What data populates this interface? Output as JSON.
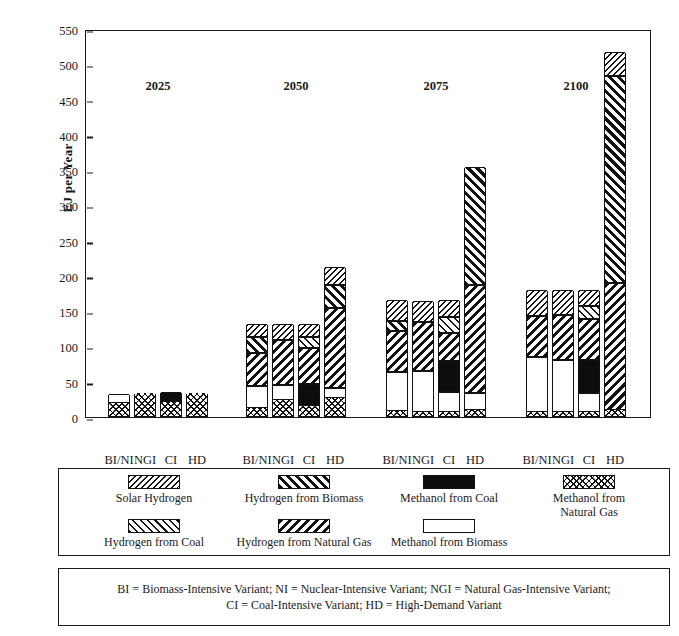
{
  "chart_data": {
    "type": "bar",
    "subtype": "stacked-grouped",
    "title": "",
    "xlabel": "",
    "ylabel": "EJ per Year",
    "ylim": [
      0,
      550
    ],
    "ytick_step": 50,
    "yticks": [
      "0",
      "50",
      "100",
      "150",
      "200",
      "250",
      "300",
      "350",
      "400",
      "450",
      "500",
      "550"
    ],
    "grid": false,
    "legend_position": "below-plot",
    "group_labels": [
      "2025",
      "2050",
      "2075",
      "2100"
    ],
    "variant_labels": [
      "BI/NI",
      "NGI",
      "CI",
      "HD"
    ],
    "series": [
      {
        "name": "Methanol from Natural Gas",
        "key": "mng",
        "pattern": "crosshatch-diamond"
      },
      {
        "name": "Methanol from Coal",
        "key": "mcoal",
        "pattern": "solid-black"
      },
      {
        "name": "Methanol from Biomass",
        "key": "mbio",
        "pattern": "white"
      },
      {
        "name": "Hydrogen from Natural Gas",
        "key": "hng",
        "pattern": "bold-backslash-hatch"
      },
      {
        "name": "Hydrogen from Coal",
        "key": "hcoal",
        "pattern": "light-slash-hatch"
      },
      {
        "name": "Hydrogen from Biomass",
        "key": "hbio",
        "pattern": "bold-slash-hatch"
      },
      {
        "name": "Solar Hydrogen",
        "key": "solar",
        "pattern": "fine-backslash-hatch"
      }
    ],
    "groups": [
      {
        "label": "2025",
        "bars": [
          {
            "variant": "BI/NI",
            "total": 31,
            "stack": [
              {
                "key": "mng",
                "value": 18
              },
              {
                "key": "mbio",
                "value": 13
              }
            ]
          },
          {
            "variant": "NGI",
            "total": 33,
            "stack": [
              {
                "key": "mng",
                "value": 33
              }
            ]
          },
          {
            "variant": "CI",
            "total": 34,
            "stack": [
              {
                "key": "mng",
                "value": 20
              },
              {
                "key": "mcoal",
                "value": 14
              }
            ]
          },
          {
            "variant": "HD",
            "total": 33,
            "stack": [
              {
                "key": "mng",
                "value": 33
              }
            ]
          }
        ]
      },
      {
        "label": "2050",
        "bars": [
          {
            "variant": "BI/NI",
            "total": 130,
            "stack": [
              {
                "key": "mng",
                "value": 12
              },
              {
                "key": "mbio",
                "value": 30
              },
              {
                "key": "hng",
                "value": 48
              },
              {
                "key": "hbio",
                "value": 22
              },
              {
                "key": "solar",
                "value": 18
              }
            ]
          },
          {
            "variant": "NGI",
            "total": 130,
            "stack": [
              {
                "key": "mng",
                "value": 22
              },
              {
                "key": "mbio",
                "value": 22
              },
              {
                "key": "hng",
                "value": 64
              },
              {
                "key": "solar",
                "value": 22
              }
            ]
          },
          {
            "variant": "CI",
            "total": 130,
            "stack": [
              {
                "key": "mng",
                "value": 14
              },
              {
                "key": "mcoal",
                "value": 32
              },
              {
                "key": "hng",
                "value": 50
              },
              {
                "key": "hcoal",
                "value": 16
              },
              {
                "key": "solar",
                "value": 18
              }
            ]
          },
          {
            "variant": "HD",
            "total": 211,
            "stack": [
              {
                "key": "mng",
                "value": 25
              },
              {
                "key": "mbio",
                "value": 15
              },
              {
                "key": "hng",
                "value": 113
              },
              {
                "key": "hbio",
                "value": 33
              },
              {
                "key": "solar",
                "value": 25
              }
            ]
          }
        ]
      },
      {
        "label": "2075",
        "bars": [
          {
            "variant": "BI/NI",
            "total": 164,
            "stack": [
              {
                "key": "mng",
                "value": 7
              },
              {
                "key": "mbio",
                "value": 56
              },
              {
                "key": "hng",
                "value": 57
              },
              {
                "key": "hbio",
                "value": 14
              },
              {
                "key": "solar",
                "value": 30
              }
            ]
          },
          {
            "variant": "NGI",
            "total": 163,
            "stack": [
              {
                "key": "mng",
                "value": 6
              },
              {
                "key": "mbio",
                "value": 58
              },
              {
                "key": "hng",
                "value": 69
              },
              {
                "key": "solar",
                "value": 30
              }
            ]
          },
          {
            "variant": "CI",
            "total": 164,
            "stack": [
              {
                "key": "mng",
                "value": 6
              },
              {
                "key": "mbio",
                "value": 28
              },
              {
                "key": "mcoal",
                "value": 44
              },
              {
                "key": "hng",
                "value": 40
              },
              {
                "key": "hcoal",
                "value": 23
              },
              {
                "key": "solar",
                "value": 23
              }
            ]
          },
          {
            "variant": "HD",
            "total": 353,
            "stack": [
              {
                "key": "mng",
                "value": 8
              },
              {
                "key": "mbio",
                "value": 24
              },
              {
                "key": "hng",
                "value": 154
              },
              {
                "key": "hbio",
                "value": 167
              }
            ]
          }
        ]
      },
      {
        "label": "2100",
        "bars": [
          {
            "variant": "BI/NI",
            "total": 178,
            "stack": [
              {
                "key": "mng",
                "value": 6
              },
              {
                "key": "mbio",
                "value": 77
              },
              {
                "key": "hng",
                "value": 59
              },
              {
                "key": "solar",
                "value": 36
              }
            ]
          },
          {
            "variant": "NGI",
            "total": 178,
            "stack": [
              {
                "key": "mng",
                "value": 6
              },
              {
                "key": "mbio",
                "value": 74
              },
              {
                "key": "hng",
                "value": 63
              },
              {
                "key": "solar",
                "value": 35
              }
            ]
          },
          {
            "variant": "CI",
            "total": 178,
            "stack": [
              {
                "key": "mng",
                "value": 6
              },
              {
                "key": "mbio",
                "value": 26
              },
              {
                "key": "mcoal",
                "value": 48
              },
              {
                "key": "hng",
                "value": 57
              },
              {
                "key": "hcoal",
                "value": 19
              },
              {
                "key": "solar",
                "value": 22
              }
            ]
          },
          {
            "variant": "HD",
            "total": 516,
            "stack": [
              {
                "key": "mng",
                "value": 8
              },
              {
                "key": "hng",
                "value": 181
              },
              {
                "key": "hbio",
                "value": 293
              },
              {
                "key": "solar",
                "value": 34
              }
            ]
          }
        ]
      }
    ]
  },
  "legend": {
    "row1": [
      {
        "label": "Solar Hydrogen",
        "key": "solar"
      },
      {
        "label": "Hydrogen from Biomass",
        "key": "hbio"
      },
      {
        "label": "Methanol from Coal",
        "key": "mcoal"
      },
      {
        "label": "Methanol from\nNatural Gas",
        "key": "mng"
      }
    ],
    "row2": [
      {
        "label": "Hydrogen from Coal",
        "key": "hcoal"
      },
      {
        "label": "Hydrogen from Natural Gas",
        "key": "hng"
      },
      {
        "label": "Methanol from Biomass",
        "key": "mbio"
      }
    ]
  },
  "note": {
    "text": "BI = Biomass-Intensive Variant; NI = Nuclear-Intensive Variant; NGI = Natural Gas-Intensive Variant;\nCI = Coal-Intensive Variant; HD = High-Demand Variant"
  }
}
